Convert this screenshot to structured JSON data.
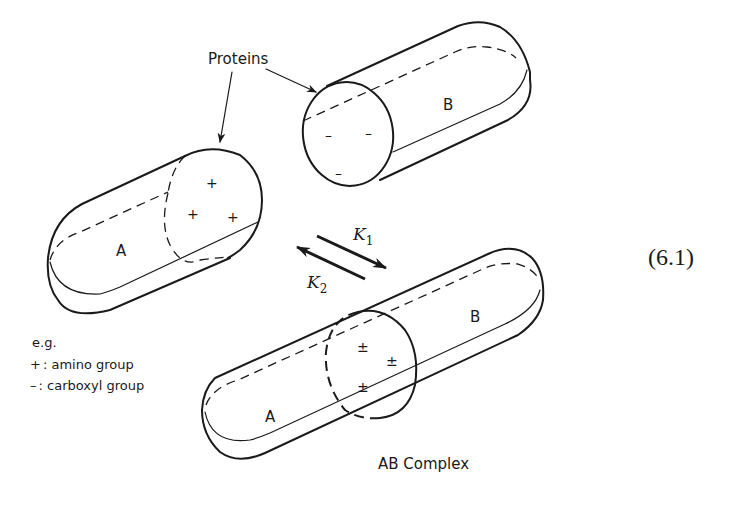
{
  "figure": {
    "callout_label": "Proteins",
    "equation_number": "(6.1)",
    "protein_a": {
      "label": "A",
      "charges": [
        "+",
        "+",
        "+"
      ]
    },
    "protein_b": {
      "label": "B",
      "charges": [
        "–",
        "–",
        "–"
      ]
    },
    "complex": {
      "label_a": "A",
      "label_b": "B",
      "charges": [
        "±",
        "±",
        "±"
      ],
      "caption": "AB Complex"
    },
    "equilibrium": {
      "forward": {
        "symbol": "K",
        "subscript": "1"
      },
      "reverse": {
        "symbol": "K",
        "subscript": "2"
      }
    },
    "legend": {
      "heading": "e.g.",
      "items": [
        {
          "symbol": "+",
          "text": ": amino group"
        },
        {
          "symbol": "–",
          "text": ": carboxyl group"
        }
      ]
    }
  }
}
